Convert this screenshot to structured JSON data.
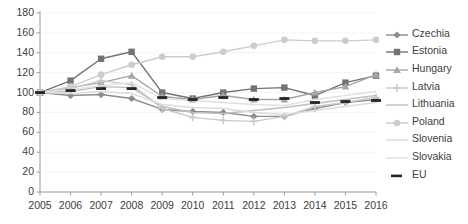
{
  "chart_data": {
    "type": "line",
    "title": "",
    "xlabel": "",
    "ylabel": "",
    "x": [
      2005,
      2006,
      2007,
      2008,
      2009,
      2010,
      2011,
      2012,
      2013,
      2014,
      2015,
      2016
    ],
    "xtick_labels": [
      "2005",
      "2006",
      "2007",
      "2008",
      "2009",
      "2010",
      "2011",
      "2012",
      "2013",
      "2014",
      "2015",
      "2016"
    ],
    "ytick_labels": [
      "0",
      "20",
      "40",
      "60",
      "80",
      "100",
      "120",
      "140",
      "160",
      "180"
    ],
    "yticks": [
      0,
      20,
      40,
      60,
      80,
      100,
      120,
      140,
      160,
      180
    ],
    "ylim": [
      0,
      180
    ],
    "grid": true,
    "legend_position": "right",
    "series": [
      {
        "name": "Czechia",
        "color": "#8c8c8c",
        "marker": "diamond",
        "dashed": false,
        "values": [
          100,
          97,
          98,
          94,
          83,
          81,
          80,
          76,
          76,
          84,
          90,
          93
        ]
      },
      {
        "name": "Estonia",
        "color": "#737373",
        "marker": "square",
        "dashed": false,
        "values": [
          100,
          112,
          134,
          141,
          100,
          94,
          100,
          104,
          105,
          97,
          110,
          117
        ]
      },
      {
        "name": "Hungary",
        "color": "#a6a6a6",
        "marker": "triangle",
        "dashed": false,
        "values": [
          100,
          105,
          110,
          117,
          96,
          93,
          97,
          93,
          93,
          100,
          106,
          118
        ]
      },
      {
        "name": "Latvia",
        "color": "#c9c9c9",
        "marker": "plus",
        "dashed": false,
        "values": [
          100,
          104,
          112,
          108,
          84,
          75,
          72,
          71,
          76,
          86,
          90,
          95
        ]
      },
      {
        "name": "Lithuania",
        "color": "#bfbfbf",
        "marker": "none",
        "dashed": false,
        "values": [
          100,
          101,
          106,
          105,
          86,
          80,
          79,
          82,
          85,
          89,
          93,
          97
        ]
      },
      {
        "name": "Poland",
        "color": "#cccccc",
        "marker": "circle",
        "dashed": false,
        "values": [
          100,
          106,
          118,
          128,
          136,
          136,
          141,
          147,
          153,
          152,
          152,
          153
        ]
      },
      {
        "name": "Slovenia",
        "color": "#dcdcdc",
        "marker": "none",
        "dashed": false,
        "values": [
          100,
          99,
          101,
          99,
          88,
          85,
          84,
          80,
          78,
          82,
          86,
          90
        ]
      },
      {
        "name": "Slovakia",
        "color": "#e0e0e0",
        "marker": "none",
        "dashed": false,
        "values": [
          100,
          103,
          107,
          110,
          94,
          92,
          90,
          88,
          87,
          93,
          97,
          101
        ]
      },
      {
        "name": "EU",
        "color": "#262626",
        "marker": "dash",
        "dashed": true,
        "values": [
          100,
          102,
          104,
          104,
          95,
          93,
          95,
          93,
          94,
          90,
          91,
          92
        ]
      }
    ]
  },
  "legend": {
    "items": [
      {
        "label": "Czechia"
      },
      {
        "label": "Estonia"
      },
      {
        "label": "Hungary"
      },
      {
        "label": "Latvia"
      },
      {
        "label": "Lithuania"
      },
      {
        "label": "Poland"
      },
      {
        "label": "Slovenia"
      },
      {
        "label": "Slovakia"
      },
      {
        "label": "EU"
      }
    ]
  },
  "axes": {
    "y_axis_name": "index-axis",
    "x_axis_name": "year-axis"
  }
}
